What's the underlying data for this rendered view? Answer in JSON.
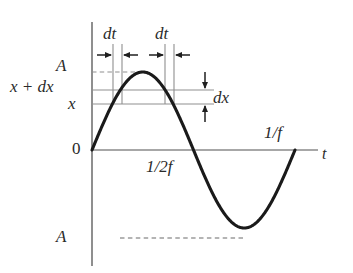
{
  "figure": {
    "background_color": "#ffffff",
    "curve_color": "#1a1a1a",
    "axis_color": "#7a7a7a",
    "guide_color": "#8c8c8c",
    "label_color": "#2a2a2a",
    "dashed_color": "#9a9a9a"
  },
  "labels": {
    "amplitude_top": "A",
    "amplitude_bottom": "A",
    "x_plus_dx": "x + dx",
    "x": "x",
    "dx": "dx",
    "dt_left": "dt",
    "dt_right": "dt",
    "origin": "0",
    "half_period": "1/2f",
    "full_period": "1/f",
    "time_axis": "t"
  },
  "chart_data": {
    "type": "line",
    "title": "",
    "xlabel": "t",
    "ylabel": "x",
    "grid": false,
    "legend": null,
    "xlim": [
      0,
      1.155
    ],
    "ylim": [
      -1.28,
      1.28
    ],
    "x_ticks": [
      {
        "value": 0,
        "label": "0"
      },
      {
        "value": 0.5,
        "label": "1/2f"
      },
      {
        "value": 1.0,
        "label": "1/f"
      }
    ],
    "y_ticks": [
      {
        "value": 1.0,
        "label": "A"
      },
      {
        "value": 0.23,
        "label": "x + dx"
      },
      {
        "value": 0.05,
        "label": "x"
      },
      {
        "value": -1.0,
        "label": "A"
      }
    ],
    "series": [
      {
        "name": "x(t) = A sin(2*pi*f*t)",
        "equation": "A sin(2 pi f t)",
        "amplitude": 1.0,
        "period": 1.0,
        "x": [
          0,
          0.05,
          0.1,
          0.15,
          0.2,
          0.25,
          0.3,
          0.35,
          0.4,
          0.45,
          0.5,
          0.55,
          0.6,
          0.65,
          0.7,
          0.75,
          0.8,
          0.85,
          0.9,
          0.95,
          1.0
        ],
        "values": [
          0,
          0.309,
          0.588,
          0.809,
          0.951,
          1.0,
          0.951,
          0.809,
          0.588,
          0.309,
          0,
          -0.309,
          -0.588,
          -0.809,
          -0.951,
          -1.0,
          -0.951,
          -0.809,
          -0.588,
          -0.309,
          0
        ]
      }
    ],
    "annotations": [
      {
        "name": "dt-interval-rising",
        "type": "horizontal-span",
        "label": "dt",
        "x_start": 0.103,
        "x_end": 0.148
      },
      {
        "name": "dt-interval-falling",
        "type": "horizontal-span",
        "label": "dt",
        "x_start": 0.36,
        "x_end": 0.405
      },
      {
        "name": "dx-interval",
        "type": "vertical-span",
        "label": "dx",
        "y_start": 0.05,
        "y_end": 0.23
      },
      {
        "name": "amplitude-top-guide",
        "type": "dashed-horizontal",
        "label": "A",
        "y": 1.0
      },
      {
        "name": "amplitude-bottom-guide",
        "type": "dashed-horizontal",
        "label": "A",
        "y": -1.0
      },
      {
        "name": "x-guide",
        "type": "solid-horizontal",
        "label": "x",
        "y": 0.05
      },
      {
        "name": "x-plus-dx-guide",
        "type": "solid-horizontal",
        "label": "x + dx",
        "y": 0.23
      }
    ]
  }
}
